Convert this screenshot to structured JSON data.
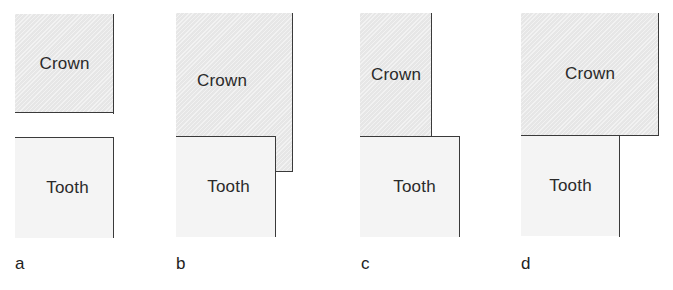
{
  "figure": {
    "panels": [
      {
        "id": "a",
        "caption": "a",
        "crown_label": "Crown",
        "tooth_label": "Tooth",
        "description": "Crown and tooth separated; crown right margin flush with tooth right margin"
      },
      {
        "id": "b",
        "caption": "b",
        "crown_label": "Crown",
        "tooth_label": "Tooth",
        "description": "Crown overhangs and extends past tooth margin (overextended)"
      },
      {
        "id": "c",
        "caption": "c",
        "crown_label": "Crown",
        "tooth_label": "Tooth",
        "description": "Crown short of tooth margin (underextended / open margin)"
      },
      {
        "id": "d",
        "caption": "d",
        "crown_label": "Crown",
        "tooth_label": "Tooth",
        "description": "Crown overhangs tooth margin horizontally"
      }
    ],
    "colors": {
      "crown_fill": "#ebebeb",
      "tooth_fill": "#f4f4f4",
      "outline": "#3a3a3a",
      "text": "#222222"
    }
  }
}
